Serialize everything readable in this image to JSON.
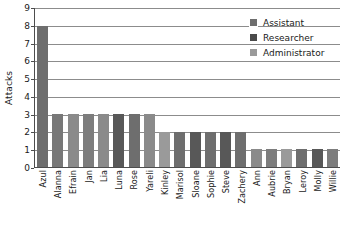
{
  "chart_data": {
    "type": "bar",
    "title": "",
    "subtitle": "",
    "xlabel": "",
    "ylabel": "Attacks",
    "ylim": [
      0,
      9
    ],
    "yticks": [
      0,
      1,
      2,
      3,
      4,
      5,
      6,
      7,
      8,
      9
    ],
    "grid": true,
    "legend_position": "top-right",
    "categories": [
      "Azul",
      "Alanna",
      "Efrain",
      "Jan",
      "Lia",
      "Luna",
      "Rose",
      "Yareli",
      "Kinley",
      "Marisol",
      "Sloane",
      "Sophie",
      "Steve",
      "Zachery",
      "Ann",
      "Aubrie",
      "Bryan",
      "Leroy",
      "Molly",
      "Willie"
    ],
    "values": [
      8,
      3,
      3,
      3,
      3,
      3,
      3,
      3,
      2,
      2,
      2,
      2,
      2,
      2,
      1,
      1,
      1,
      1,
      1,
      1
    ],
    "bar_colors": [
      "#6e6e6e",
      "#787878",
      "#8a8a8a",
      "#7d7d7d",
      "#8a8a8a",
      "#585858",
      "#6e6e6e",
      "#8a8a8a",
      "#9a9a9a",
      "#6e6e6e",
      "#585858",
      "#6e6e6e",
      "#585858",
      "#6e6e6e",
      "#8a8a8a",
      "#7d7d7d",
      "#9a9a9a",
      "#6e6e6e",
      "#585858",
      "#7d7d7d"
    ],
    "legend": [
      {
        "label": "Assistant",
        "color": "#6e6e6e"
      },
      {
        "label": "Researcher",
        "color": "#4a4a4a"
      },
      {
        "label": "Administrator",
        "color": "#9a9a9a"
      }
    ]
  },
  "axis_colors": {
    "gridline": "#8c8c8c",
    "axis": "#4d4d4d",
    "text": "#1a1a1a"
  }
}
